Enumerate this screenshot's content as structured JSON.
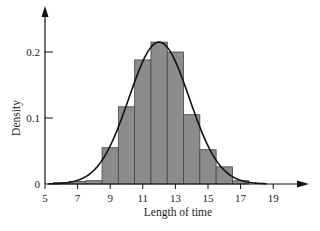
{
  "chart_data": {
    "type": "bar",
    "subtype": "histogram_with_density_curve",
    "title": "",
    "xlabel": "Length of time",
    "ylabel": "Density",
    "xlim": [
      5,
      20.5
    ],
    "ylim": [
      0,
      0.25
    ],
    "x_ticks": [
      5,
      7,
      9,
      11,
      13,
      15,
      17,
      19
    ],
    "y_ticks": [
      0,
      0.1,
      0.2
    ],
    "y_tick_labels": [
      "0",
      "0.1",
      "0.2"
    ],
    "grid": false,
    "legend": null,
    "bin_width": 1,
    "bins": [
      {
        "start": 5.5,
        "end": 6.5,
        "density": 0.002
      },
      {
        "start": 6.5,
        "end": 7.5,
        "density": 0.004
      },
      {
        "start": 7.5,
        "end": 8.5,
        "density": 0.005
      },
      {
        "start": 8.5,
        "end": 9.5,
        "density": 0.055
      },
      {
        "start": 9.5,
        "end": 10.5,
        "density": 0.117
      },
      {
        "start": 10.5,
        "end": 11.5,
        "density": 0.188
      },
      {
        "start": 11.5,
        "end": 12.5,
        "density": 0.215
      },
      {
        "start": 12.5,
        "end": 13.5,
        "density": 0.2
      },
      {
        "start": 13.5,
        "end": 14.5,
        "density": 0.105
      },
      {
        "start": 14.5,
        "end": 15.5,
        "density": 0.052
      },
      {
        "start": 15.5,
        "end": 16.5,
        "density": 0.026
      },
      {
        "start": 16.5,
        "end": 17.5,
        "density": 0.005
      }
    ],
    "curve": {
      "type": "normal",
      "mean": 12,
      "sd": 1.85,
      "peak_density": 0.215
    },
    "colors": {
      "bar_fill": "#8c8c8c",
      "bar_edge": "#444444",
      "curve": "#111111",
      "axis": "#111111"
    }
  }
}
